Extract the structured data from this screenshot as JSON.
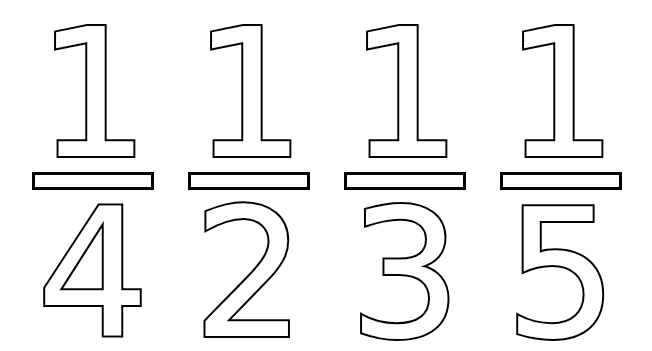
{
  "worksheet": {
    "fractions": [
      {
        "numerator": "1",
        "denominator": "4"
      },
      {
        "numerator": "1",
        "denominator": "2"
      },
      {
        "numerator": "1",
        "denominator": "3"
      },
      {
        "numerator": "1",
        "denominator": "5"
      }
    ],
    "colors": {
      "outline": "#000000",
      "fill": "#ffffff",
      "background": "#ffffff"
    }
  }
}
